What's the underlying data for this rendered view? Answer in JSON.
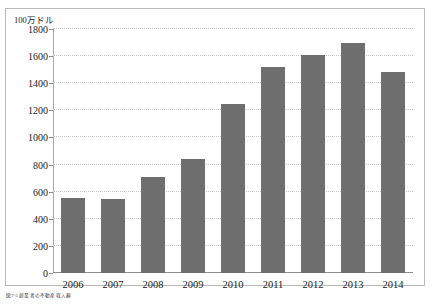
{
  "figure": {
    "caption": "図7-5 創業者の不動産収入額"
  },
  "chart_data": {
    "type": "bar",
    "title": "",
    "subtitle": "",
    "xlabel": "",
    "ylabel": "100万ドル",
    "unit_label": "100万ドル",
    "categories": [
      "2006",
      "2007",
      "2008",
      "2009",
      "2010",
      "2011",
      "2012",
      "2013",
      "2014"
    ],
    "values": [
      555,
      545,
      710,
      840,
      1250,
      1520,
      1610,
      1700,
      1480
    ],
    "series": [
      {
        "name": "金額",
        "values": [
          555,
          545,
          710,
          840,
          1250,
          1520,
          1610,
          1700,
          1480
        ]
      }
    ],
    "ylim": [
      0,
      1800
    ],
    "ytick_values": [
      0,
      200,
      400,
      600,
      800,
      1000,
      1200,
      1400,
      1600,
      1800
    ],
    "ytick_labels": [
      "0",
      "200",
      "400",
      "600",
      "800",
      "1000",
      "1200",
      "1400",
      "1600",
      "1800"
    ],
    "grid": true,
    "grid_style": "dotted",
    "legend": false,
    "legend_position": "none",
    "bar_color": "#6e6e6e",
    "grid_color": "#c8c8c8",
    "axis_color": "#8c8c8c",
    "background_color": "#ffffff"
  }
}
